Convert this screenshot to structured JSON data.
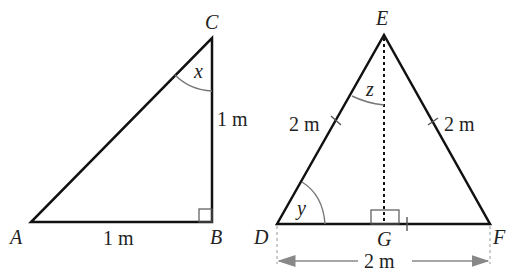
{
  "diagram": {
    "triangle_abc": {
      "vertices": [
        "A",
        "B",
        "C"
      ],
      "right_angle_at": "B",
      "side_ab": "1 m",
      "side_bc": "1 m",
      "angle_c_label": "x"
    },
    "triangle_def": {
      "vertices": [
        "D",
        "E",
        "F",
        "G"
      ],
      "side_de": "2 m",
      "side_ef": "2 m",
      "side_df": "2 m",
      "angle_d_label": "y",
      "angle_e_half_label": "z",
      "altitude": "EG",
      "right_angle_at": "G"
    }
  },
  "labels": {
    "A": "A",
    "B": "B",
    "C": "C",
    "D": "D",
    "E": "E",
    "F": "F",
    "G": "G",
    "x": "x",
    "y": "y",
    "z": "z",
    "ab": "1 m",
    "bc": "1 m",
    "de": "2 m",
    "ef": "2 m",
    "df": "2 m"
  },
  "colors": {
    "line": "#111111",
    "arc": "#777777",
    "dim": "#888888"
  }
}
